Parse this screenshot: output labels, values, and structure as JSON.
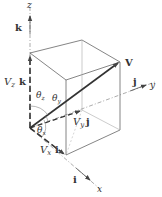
{
  "diagram": {
    "axes": {
      "x": "x",
      "y": "y",
      "z": "z"
    },
    "unit_vectors": {
      "i": "i",
      "j": "j",
      "k": "k"
    },
    "vector": "V",
    "components": {
      "x": {
        "symbol": "V",
        "sub": "x",
        "unit": "i"
      },
      "y": {
        "symbol": "V",
        "sub": "y",
        "unit": "j"
      },
      "z": {
        "symbol": "V",
        "sub": "z",
        "unit": "k"
      }
    },
    "angles": {
      "x": {
        "symbol": "θ",
        "sub": "x"
      },
      "y": {
        "symbol": "θ",
        "sub": "y"
      },
      "z": {
        "symbol": "θ",
        "sub": "z"
      }
    },
    "colors": {
      "line": "#555555",
      "light_line": "#999999",
      "text": "#333333"
    }
  }
}
